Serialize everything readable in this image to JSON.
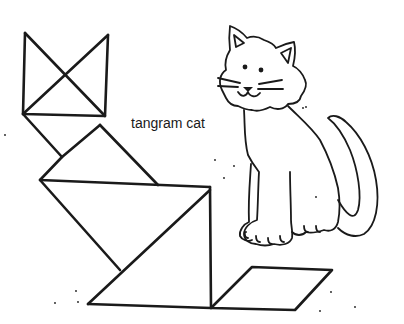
{
  "illustration": {
    "caption": "tangram cat",
    "subjects": [
      "tangram-cat-figure",
      "cartoon-cat-drawing"
    ],
    "stroke_color": "#1a1a1a",
    "background_color": "#ffffff"
  }
}
